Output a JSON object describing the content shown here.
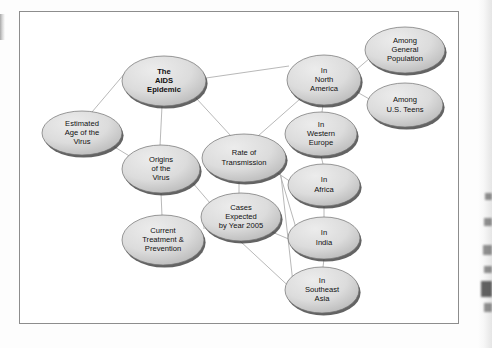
{
  "diagram": {
    "frame": {
      "border_color": "#8d8d8d",
      "background": "#ffffff"
    },
    "style": {
      "node_fill_top": "#e8e8e8",
      "node_fill_bottom": "#b4b4b4",
      "node_stroke": "#6e6e6e",
      "node_shadow": "#2f2f2f",
      "connector_color": "#b0b0b0",
      "text_color": "#101010"
    },
    "nodes": [
      {
        "id": "aids-epidemic",
        "lines": [
          "The",
          "AIDS",
          "Epidemic"
        ],
        "cx": 164,
        "cy": 81,
        "rx": 42,
        "ry": 25,
        "bold": true
      },
      {
        "id": "estimated-age",
        "lines": [
          "Estimated",
          "Age of the",
          "Virus"
        ],
        "cx": 82,
        "cy": 133,
        "rx": 40,
        "ry": 22,
        "bold": false
      },
      {
        "id": "origins-of-virus",
        "lines": [
          "Origins",
          "of the",
          "Virus"
        ],
        "cx": 161,
        "cy": 169,
        "rx": 39,
        "ry": 24,
        "bold": false
      },
      {
        "id": "current-treatment",
        "lines": [
          "Current",
          "Treatment &",
          "Prevention"
        ],
        "cx": 163,
        "cy": 240,
        "rx": 41,
        "ry": 25,
        "bold": false
      },
      {
        "id": "rate-of-transmission",
        "lines": [
          "Rate of",
          "Transmission"
        ],
        "cx": 244,
        "cy": 158,
        "rx": 42,
        "ry": 24,
        "bold": false
      },
      {
        "id": "cases-expected",
        "lines": [
          "Cases",
          "Expected",
          "by Year 2005"
        ],
        "cx": 241,
        "cy": 217,
        "rx": 40,
        "ry": 24,
        "bold": false
      },
      {
        "id": "in-north-america",
        "lines": [
          "In",
          "North",
          "America"
        ],
        "cx": 324,
        "cy": 80,
        "rx": 37,
        "ry": 25,
        "bold": false
      },
      {
        "id": "among-general",
        "lines": [
          "Among",
          "General",
          "Population"
        ],
        "cx": 405,
        "cy": 50,
        "rx": 40,
        "ry": 23,
        "bold": false
      },
      {
        "id": "among-us-teens",
        "lines": [
          "Among",
          "U.S. Teens"
        ],
        "cx": 405,
        "cy": 105,
        "rx": 38,
        "ry": 22,
        "bold": false
      },
      {
        "id": "in-western-europe",
        "lines": [
          "In",
          "Western",
          "Europe"
        ],
        "cx": 321,
        "cy": 134,
        "rx": 36,
        "ry": 22,
        "bold": false
      },
      {
        "id": "in-africa",
        "lines": [
          "In",
          "Africa"
        ],
        "cx": 324,
        "cy": 185,
        "rx": 36,
        "ry": 21,
        "bold": false
      },
      {
        "id": "in-india",
        "lines": [
          "In",
          "India"
        ],
        "cx": 324,
        "cy": 238,
        "rx": 36,
        "ry": 21,
        "bold": false
      },
      {
        "id": "in-southeast-asia",
        "lines": [
          "In",
          "Southeast",
          "Asia"
        ],
        "cx": 322,
        "cy": 290,
        "rx": 37,
        "ry": 23,
        "bold": false
      }
    ],
    "edges": [
      {
        "from": "aids-epidemic",
        "to": "estimated-age",
        "x1": 131,
        "y1": 66,
        "x2": 92,
        "y2": 112
      },
      {
        "from": "aids-epidemic",
        "to": "origins-of-virus",
        "x1": 162,
        "y1": 106,
        "x2": 160,
        "y2": 146
      },
      {
        "from": "aids-epidemic",
        "to": "rate-of-transmission",
        "x1": 196,
        "y1": 98,
        "x2": 231,
        "y2": 136
      },
      {
        "from": "aids-epidemic",
        "to": "in-north-america",
        "x1": 206,
        "y1": 78,
        "x2": 289,
        "y2": 66
      },
      {
        "from": "estimated-age",
        "to": "origins-of-virus",
        "x1": 113,
        "y1": 146,
        "x2": 131,
        "y2": 157
      },
      {
        "from": "origins-of-virus",
        "to": "current-treatment",
        "x1": 161,
        "y1": 193,
        "x2": 162,
        "y2": 216
      },
      {
        "from": "origins-of-virus",
        "to": "cases-expected",
        "x1": 192,
        "y1": 182,
        "x2": 210,
        "y2": 203
      },
      {
        "from": "rate-of-transmission",
        "to": "in-north-america",
        "x1": 258,
        "y1": 136,
        "x2": 300,
        "y2": 99
      },
      {
        "from": "rate-of-transmission",
        "to": "cases-expected",
        "x1": 239,
        "y1": 182,
        "x2": 239,
        "y2": 194
      },
      {
        "from": "rate-of-transmission",
        "to": "in-africa",
        "x1": 276,
        "y1": 172,
        "x2": 291,
        "y2": 182
      },
      {
        "from": "rate-of-transmission",
        "to": "in-india",
        "x1": 280,
        "y1": 174,
        "x2": 296,
        "y2": 228
      },
      {
        "from": "rate-of-transmission",
        "to": "in-southeast-asia",
        "x1": 281,
        "y1": 176,
        "x2": 293,
        "y2": 283
      },
      {
        "from": "cases-expected",
        "to": "in-india",
        "x1": 272,
        "y1": 232,
        "x2": 291,
        "y2": 240
      },
      {
        "from": "cases-expected",
        "to": "in-southeast-asia",
        "x1": 240,
        "y1": 241,
        "x2": 296,
        "y2": 293
      },
      {
        "from": "in-north-america",
        "to": "among-general",
        "x1": 356,
        "y1": 70,
        "x2": 370,
        "y2": 58
      },
      {
        "from": "in-north-america",
        "to": "among-us-teens",
        "x1": 357,
        "y1": 92,
        "x2": 371,
        "y2": 100
      },
      {
        "from": "in-north-america",
        "to": "in-western-europe",
        "x1": 323,
        "y1": 105,
        "x2": 322,
        "y2": 112
      },
      {
        "from": "in-western-europe",
        "to": "in-africa",
        "x1": 321,
        "y1": 156,
        "x2": 323,
        "y2": 164
      },
      {
        "from": "in-africa",
        "to": "in-india",
        "x1": 324,
        "y1": 206,
        "x2": 324,
        "y2": 217
      },
      {
        "from": "in-india",
        "to": "in-southeast-asia",
        "x1": 324,
        "y1": 259,
        "x2": 323,
        "y2": 267
      },
      {
        "from": "current-treatment",
        "to": "cases-expected",
        "x1": 204,
        "y1": 229,
        "x2": 204,
        "y2": 224
      }
    ]
  }
}
